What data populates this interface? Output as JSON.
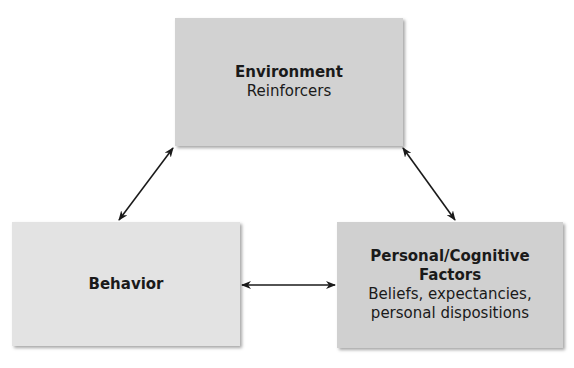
{
  "diagram": {
    "nodes": [
      {
        "id": "environment",
        "title": "Environment",
        "subtitle": "Reinforcers"
      },
      {
        "id": "behavior",
        "title": "Behavior",
        "subtitle": ""
      },
      {
        "id": "personal",
        "title": "Personal/Cognitive Factors",
        "title_line1": "Personal/Cognitive",
        "title_line2": "Factors",
        "subtitle_line1": "Beliefs, expectancies,",
        "subtitle_line2": "personal dispositions"
      }
    ],
    "edges": [
      {
        "from": "environment",
        "to": "behavior",
        "type": "bidirectional"
      },
      {
        "from": "environment",
        "to": "personal",
        "type": "bidirectional"
      },
      {
        "from": "behavior",
        "to": "personal",
        "type": "bidirectional"
      }
    ],
    "colors": {
      "box_env": "#d2d2d2",
      "box_behavior": "#e3e3e3",
      "box_personal": "#d0d0d0",
      "arrow": "#1a1a1a"
    }
  }
}
